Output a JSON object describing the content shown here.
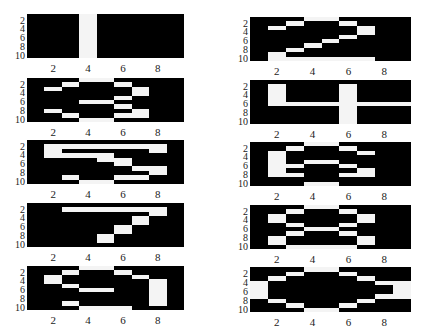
{
  "figure": {
    "panels": [
      {
        "id": "L1",
        "left": 27,
        "top": 14,
        "width": 157,
        "height": 44,
        "matrix": [
          [
            0,
            0,
            0,
            1,
            0,
            0,
            0,
            0,
            0
          ],
          [
            0,
            0,
            0,
            1,
            0,
            0,
            0,
            0,
            0
          ],
          [
            0,
            0,
            0,
            1,
            0,
            0,
            0,
            0,
            0
          ],
          [
            0,
            0,
            0,
            1,
            0,
            0,
            0,
            0,
            0
          ],
          [
            0,
            0,
            0,
            1,
            0,
            0,
            0,
            0,
            0
          ],
          [
            0,
            0,
            0,
            1,
            0,
            0,
            0,
            0,
            0
          ],
          [
            0,
            0,
            0,
            1,
            0,
            0,
            0,
            0,
            0
          ],
          [
            0,
            0,
            0,
            1,
            0,
            0,
            0,
            0,
            0
          ],
          [
            0,
            0,
            0,
            1,
            0,
            0,
            0,
            0,
            0
          ],
          [
            0,
            0,
            0,
            1,
            0,
            0,
            0,
            0,
            0
          ]
        ]
      },
      {
        "id": "R1",
        "left": 250,
        "top": 17,
        "width": 161,
        "height": 44,
        "matrix": [
          [
            0,
            0,
            0,
            1,
            1,
            0,
            0,
            0,
            0
          ],
          [
            0,
            0,
            1,
            0,
            0,
            1,
            0,
            0,
            0
          ],
          [
            0,
            1,
            0,
            0,
            0,
            0,
            1,
            0,
            0
          ],
          [
            0,
            0,
            0,
            0,
            0,
            0,
            1,
            0,
            0
          ],
          [
            0,
            0,
            0,
            0,
            0,
            1,
            0,
            0,
            0
          ],
          [
            0,
            0,
            0,
            0,
            1,
            0,
            0,
            0,
            0
          ],
          [
            0,
            0,
            0,
            1,
            0,
            0,
            0,
            0,
            0
          ],
          [
            0,
            0,
            1,
            0,
            0,
            0,
            0,
            0,
            0
          ],
          [
            0,
            1,
            0,
            0,
            0,
            0,
            0,
            0,
            0
          ],
          [
            0,
            1,
            1,
            1,
            1,
            1,
            1,
            0,
            0
          ]
        ]
      },
      {
        "id": "L2",
        "left": 27,
        "top": 78,
        "width": 157,
        "height": 44,
        "matrix": [
          [
            0,
            0,
            0,
            1,
            1,
            0,
            0,
            0,
            0
          ],
          [
            0,
            0,
            1,
            0,
            0,
            1,
            0,
            0,
            0
          ],
          [
            0,
            1,
            0,
            0,
            0,
            0,
            1,
            0,
            0
          ],
          [
            0,
            0,
            0,
            0,
            0,
            0,
            1,
            0,
            0
          ],
          [
            0,
            0,
            0,
            0,
            0,
            1,
            0,
            0,
            0
          ],
          [
            0,
            0,
            0,
            1,
            1,
            0,
            0,
            0,
            0
          ],
          [
            0,
            0,
            0,
            0,
            0,
            1,
            0,
            0,
            0
          ],
          [
            0,
            1,
            0,
            0,
            0,
            0,
            1,
            0,
            0
          ],
          [
            0,
            0,
            1,
            0,
            0,
            1,
            1,
            0,
            0
          ],
          [
            0,
            0,
            0,
            1,
            1,
            0,
            0,
            0,
            0
          ]
        ]
      },
      {
        "id": "R2",
        "left": 250,
        "top": 80,
        "width": 161,
        "height": 44,
        "matrix": [
          [
            0,
            0,
            0,
            0,
            0,
            0,
            0,
            0,
            0
          ],
          [
            0,
            1,
            0,
            0,
            0,
            1,
            0,
            0,
            0
          ],
          [
            0,
            1,
            0,
            0,
            0,
            1,
            0,
            0,
            0
          ],
          [
            0,
            1,
            0,
            0,
            0,
            1,
            0,
            0,
            0
          ],
          [
            0,
            1,
            0,
            0,
            0,
            1,
            0,
            0,
            0
          ],
          [
            0,
            1,
            1,
            1,
            1,
            1,
            1,
            1,
            1
          ],
          [
            0,
            0,
            0,
            0,
            0,
            1,
            0,
            0,
            0
          ],
          [
            0,
            0,
            0,
            0,
            0,
            1,
            0,
            0,
            0
          ],
          [
            0,
            0,
            0,
            0,
            0,
            1,
            0,
            0,
            0
          ],
          [
            0,
            0,
            0,
            0,
            0,
            1,
            0,
            0,
            0
          ]
        ]
      },
      {
        "id": "L3",
        "left": 27,
        "top": 140,
        "width": 157,
        "height": 44,
        "matrix": [
          [
            0,
            0,
            0,
            0,
            0,
            0,
            0,
            0,
            0
          ],
          [
            0,
            1,
            1,
            1,
            1,
            1,
            1,
            1,
            0
          ],
          [
            0,
            1,
            0,
            0,
            0,
            0,
            0,
            1,
            0
          ],
          [
            0,
            1,
            1,
            1,
            1,
            0,
            0,
            0,
            0
          ],
          [
            0,
            0,
            0,
            0,
            1,
            1,
            0,
            0,
            0
          ],
          [
            0,
            0,
            0,
            0,
            0,
            1,
            0,
            0,
            0
          ],
          [
            0,
            0,
            0,
            0,
            0,
            0,
            1,
            1,
            0
          ],
          [
            0,
            0,
            0,
            0,
            0,
            0,
            0,
            1,
            0
          ],
          [
            0,
            0,
            1,
            0,
            0,
            1,
            1,
            0,
            0
          ],
          [
            0,
            0,
            0,
            1,
            1,
            0,
            0,
            0,
            0
          ]
        ]
      },
      {
        "id": "R3",
        "left": 250,
        "top": 142,
        "width": 161,
        "height": 44,
        "matrix": [
          [
            0,
            0,
            0,
            1,
            1,
            0,
            0,
            0,
            0
          ],
          [
            0,
            0,
            1,
            0,
            0,
            1,
            0,
            0,
            0
          ],
          [
            0,
            1,
            0,
            0,
            0,
            0,
            1,
            0,
            0
          ],
          [
            0,
            1,
            0,
            0,
            0,
            0,
            0,
            0,
            0
          ],
          [
            0,
            1,
            0,
            1,
            1,
            0,
            0,
            0,
            0
          ],
          [
            0,
            1,
            1,
            0,
            0,
            1,
            0,
            0,
            0
          ],
          [
            0,
            1,
            0,
            0,
            0,
            0,
            1,
            0,
            0
          ],
          [
            0,
            1,
            1,
            0,
            0,
            1,
            1,
            0,
            0
          ],
          [
            0,
            0,
            0,
            0,
            0,
            0,
            0,
            0,
            0
          ],
          [
            0,
            0,
            0,
            1,
            1,
            0,
            0,
            0,
            0
          ]
        ]
      },
      {
        "id": "L4",
        "left": 27,
        "top": 203,
        "width": 157,
        "height": 44,
        "matrix": [
          [
            0,
            0,
            0,
            0,
            0,
            0,
            0,
            0,
            0
          ],
          [
            0,
            0,
            1,
            1,
            1,
            1,
            1,
            1,
            0
          ],
          [
            0,
            0,
            0,
            0,
            0,
            0,
            0,
            1,
            0
          ],
          [
            0,
            0,
            0,
            0,
            0,
            0,
            1,
            0,
            0
          ],
          [
            0,
            0,
            0,
            0,
            0,
            0,
            1,
            0,
            0
          ],
          [
            0,
            0,
            0,
            0,
            0,
            1,
            0,
            0,
            0
          ],
          [
            0,
            0,
            0,
            0,
            0,
            1,
            0,
            0,
            0
          ],
          [
            0,
            0,
            0,
            0,
            1,
            0,
            0,
            0,
            0
          ],
          [
            0,
            0,
            0,
            0,
            1,
            0,
            0,
            0,
            0
          ],
          [
            0,
            0,
            0,
            0,
            0,
            0,
            0,
            0,
            0
          ]
        ]
      },
      {
        "id": "R4",
        "left": 250,
        "top": 205,
        "width": 161,
        "height": 44,
        "matrix": [
          [
            0,
            0,
            0,
            1,
            1,
            0,
            0,
            0,
            0
          ],
          [
            0,
            0,
            1,
            0,
            0,
            1,
            0,
            0,
            0
          ],
          [
            0,
            1,
            0,
            0,
            0,
            0,
            1,
            0,
            0
          ],
          [
            0,
            1,
            0,
            0,
            0,
            0,
            1,
            0,
            0
          ],
          [
            0,
            0,
            1,
            0,
            0,
            1,
            0,
            0,
            0
          ],
          [
            0,
            0,
            0,
            1,
            1,
            0,
            0,
            0,
            0
          ],
          [
            0,
            0,
            1,
            0,
            0,
            1,
            0,
            0,
            0
          ],
          [
            0,
            1,
            0,
            0,
            0,
            0,
            1,
            0,
            0
          ],
          [
            0,
            1,
            0,
            0,
            0,
            0,
            1,
            0,
            0
          ],
          [
            0,
            0,
            1,
            1,
            1,
            1,
            0,
            0,
            0
          ]
        ]
      },
      {
        "id": "L5",
        "left": 27,
        "top": 266,
        "width": 157,
        "height": 44,
        "matrix": [
          [
            0,
            0,
            0,
            1,
            1,
            0,
            0,
            0,
            0
          ],
          [
            0,
            0,
            1,
            0,
            0,
            1,
            0,
            0,
            0
          ],
          [
            0,
            1,
            0,
            0,
            0,
            0,
            1,
            0,
            0
          ],
          [
            0,
            1,
            0,
            0,
            0,
            0,
            0,
            1,
            0
          ],
          [
            0,
            0,
            1,
            0,
            0,
            0,
            0,
            1,
            0
          ],
          [
            0,
            0,
            0,
            1,
            1,
            0,
            0,
            1,
            0
          ],
          [
            0,
            0,
            0,
            0,
            0,
            0,
            0,
            1,
            0
          ],
          [
            0,
            0,
            0,
            0,
            0,
            0,
            0,
            1,
            0
          ],
          [
            0,
            0,
            1,
            0,
            0,
            0,
            0,
            1,
            0
          ],
          [
            0,
            0,
            0,
            1,
            1,
            1,
            0,
            0,
            0
          ]
        ]
      },
      {
        "id": "R5",
        "left": 250,
        "top": 267,
        "width": 161,
        "height": 45,
        "matrix": [
          [
            0,
            0,
            0,
            1,
            1,
            0,
            0,
            0,
            0
          ],
          [
            0,
            0,
            1,
            0,
            0,
            1,
            0,
            0,
            0
          ],
          [
            0,
            1,
            0,
            0,
            0,
            0,
            1,
            0,
            0
          ],
          [
            1,
            0,
            0,
            0,
            0,
            0,
            0,
            1,
            1
          ],
          [
            1,
            0,
            0,
            0,
            0,
            0,
            0,
            0,
            1
          ],
          [
            1,
            0,
            0,
            0,
            0,
            0,
            0,
            0,
            1
          ],
          [
            1,
            0,
            0,
            0,
            0,
            0,
            0,
            1,
            1
          ],
          [
            0,
            1,
            0,
            0,
            0,
            0,
            1,
            0,
            0
          ],
          [
            0,
            0,
            1,
            0,
            0,
            1,
            0,
            0,
            0
          ],
          [
            0,
            0,
            0,
            1,
            1,
            0,
            0,
            0,
            0
          ]
        ]
      }
    ],
    "y_tick_labels": [
      "2",
      "4",
      "6",
      "8",
      "10"
    ],
    "x_tick_labels": [
      "2",
      "4",
      "6",
      "8"
    ],
    "colors": {
      "on": "#f4f4f4",
      "off": "#000000",
      "text": "#222222"
    }
  }
}
